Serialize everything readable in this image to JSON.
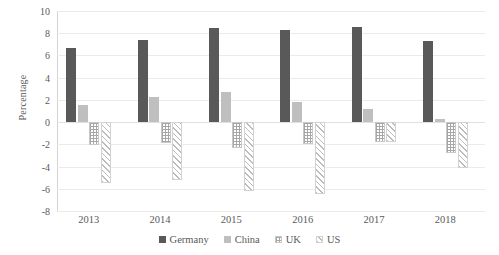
{
  "chart_data": {
    "type": "bar",
    "title": "",
    "xlabel": "",
    "ylabel": "Percentage",
    "categories": [
      "2013",
      "2014",
      "2015",
      "2016",
      "2017",
      "2018"
    ],
    "series": [
      {
        "name": "Germany",
        "color": "#595959",
        "pattern": "solid",
        "values": [
          6.7,
          7.4,
          8.5,
          8.3,
          8.6,
          7.3
        ]
      },
      {
        "name": "China",
        "color": "#bfbfbf",
        "pattern": "solid",
        "values": [
          1.5,
          2.3,
          2.7,
          1.8,
          1.2,
          0.3
        ]
      },
      {
        "name": "UK",
        "color": "#a6a6a6",
        "pattern": "dotted-grid",
        "values": [
          -2.1,
          -1.9,
          -2.3,
          -2.0,
          -1.8,
          -2.8
        ]
      },
      {
        "name": "US",
        "color": "#bcbcbc",
        "pattern": "diagonal-hatch",
        "values": [
          -5.5,
          -5.2,
          -6.2,
          -6.5,
          -1.8,
          -4.1
        ]
      }
    ],
    "ylim": [
      -8,
      10
    ],
    "ytick_step": 2,
    "yticks": [
      "10",
      "8",
      "6",
      "4",
      "2",
      "0",
      "-2",
      "-4",
      "-6",
      "-8"
    ],
    "grid": true,
    "legend_position": "bottom"
  },
  "legend": {
    "items": [
      {
        "label": "Germany"
      },
      {
        "label": "China"
      },
      {
        "label": "UK"
      },
      {
        "label": "US"
      }
    ]
  }
}
